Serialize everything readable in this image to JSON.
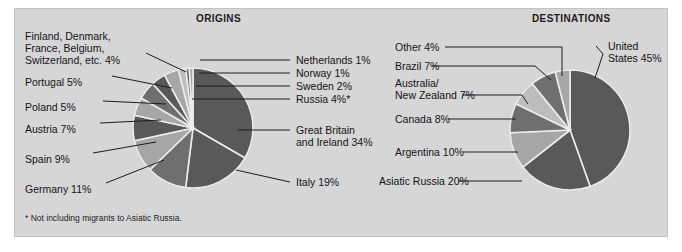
{
  "figure": {
    "background_color": "#d6d6d6",
    "page_color": "#ffffff",
    "footnote": "* Not including migrants to Asiatic Russia."
  },
  "palette": {
    "dark": "#595959",
    "mid": "#6f6f6f",
    "light": "#a6a6a6",
    "lighter": "#bdbdbd",
    "white_divider": "#ececec",
    "text": "#141414"
  },
  "chart_data": [
    {
      "type": "pie",
      "title": "ORIGINS",
      "labels": [
        "Great Britain and Ireland 34%",
        "Italy 19%",
        "Germany 11%",
        "Spain 9%",
        "Austria 7%",
        "Poland 5%",
        "Portugal 5%",
        "Finland, Denmark, France, Belgium, Switzerland, etc. 4%",
        "Russia 4%*",
        "Sweden 2%",
        "Norway 1%",
        "Netherlands 1%"
      ],
      "categories": [
        "Great Britain and Ireland",
        "Italy",
        "Germany",
        "Spain",
        "Austria",
        "Poland",
        "Portugal",
        "Finland, Denmark, France, Belgium, Switzerland, etc.",
        "Russia",
        "Sweden",
        "Norway",
        "Netherlands"
      ],
      "values": [
        34,
        19,
        11,
        9,
        7,
        5,
        5,
        4,
        4,
        2,
        1,
        1
      ],
      "units": "percent",
      "legend_position": "leader-lines"
    },
    {
      "type": "pie",
      "title": "DESTINATIONS",
      "labels": [
        "United States 45%",
        "Asiatic Russia 20%",
        "Argentina 10%",
        "Canada 8%",
        "Australia/ New Zealand 7%",
        "Brazil 7%",
        "Other 4%"
      ],
      "categories": [
        "United States",
        "Asiatic Russia",
        "Argentina",
        "Canada",
        "Australia/New Zealand",
        "Brazil",
        "Other"
      ],
      "values": [
        45,
        20,
        10,
        8,
        7,
        7,
        4
      ],
      "units": "percent",
      "legend_position": "leader-lines"
    }
  ],
  "origins": {
    "title": "ORIGINS",
    "labels": {
      "finland_group": "Finland, Denmark,\nFrance, Belgium,\nSwitzerland, etc.  4%",
      "finland_l1": "Finland, Denmark,",
      "finland_l2": "France, Belgium,",
      "finland_l3": "Switzerland, etc.  4%",
      "portugal": "Portugal  5%",
      "poland": "Poland  5%",
      "austria": "Austria  7%",
      "spain": "Spain  9%",
      "germany": "Germany  11%",
      "netherlands": "Netherlands 1%",
      "norway": "Norway 1%",
      "sweden": "Sweden 2%",
      "russia": "Russia 4%*",
      "gb_l1": "Great Britain",
      "gb_l2": "and Ireland 34%",
      "italy": "Italy 19%"
    }
  },
  "destinations": {
    "title": "DESTINATIONS",
    "labels": {
      "other": "Other  4%",
      "brazil": "Brazil  7%",
      "anz_l1": "Australia/",
      "anz_l2": "New Zealand  7%",
      "canada": "Canada  8%",
      "argentina": "Argentina  10%",
      "asiatic_russia": "Asiatic Russia  20%",
      "us_l1": "United",
      "us_l2": "States 45%"
    }
  }
}
